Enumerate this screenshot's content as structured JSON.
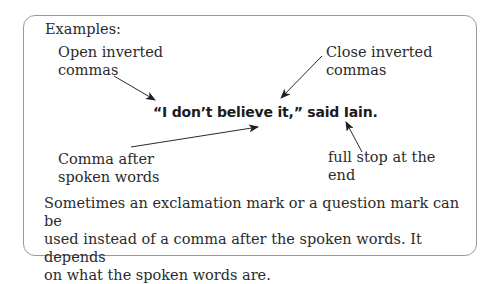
{
  "heading": "Examples:",
  "example_sentence": "“I don’t believe it,” said Iain.",
  "labels": {
    "open_inverted_commas": [
      "Open inverted",
      "commas"
    ],
    "close_inverted_commas": [
      "Close inverted",
      "commas"
    ],
    "comma_after": [
      "Comma after",
      "spoken words"
    ],
    "full_stop": [
      "full stop at the",
      "end"
    ]
  },
  "paragraph": [
    "Sometimes an exclamation mark or a question mark can be",
    "used instead of a comma after the spoken words. It depends",
    "on what the spoken words are."
  ]
}
